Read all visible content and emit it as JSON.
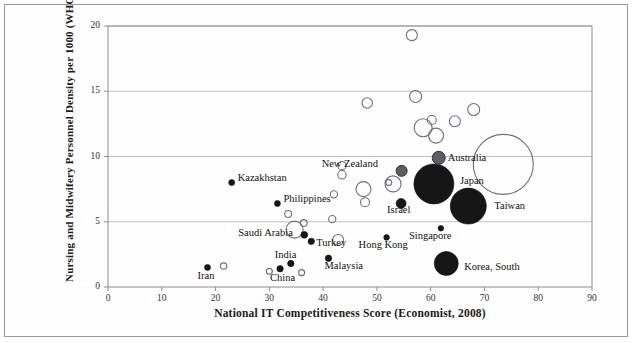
{
  "chart_data": {
    "type": "scatter",
    "title": "",
    "xlabel": "National IT Competitiveness Score (Economist, 2008)",
    "ylabel": "Nursing and Midwifery Personnel  Density per 1000 (WHO, 2009)",
    "xlim": [
      0,
      90
    ],
    "ylim": [
      0,
      20
    ],
    "xticks": [
      0,
      10,
      20,
      30,
      40,
      50,
      60,
      70,
      80,
      90
    ],
    "yticks": [
      0,
      5,
      10,
      15,
      20
    ],
    "grid": "horizontal",
    "legend": "none",
    "marker_styles": {
      "filled_black": "labeled country, small solid marker",
      "open_circle": "unlabeled country bubble",
      "gray_filled": "labeled country, medium gray marker",
      "large_black": "labeled country, large solid bubble"
    },
    "points": [
      {
        "label": "Iran",
        "x": 18.5,
        "y": 1.5,
        "r": 3,
        "style": "filled_black",
        "label_dx": -10,
        "label_dy": 9
      },
      {
        "label": "",
        "x": 21.5,
        "y": 1.6,
        "r": 3.2,
        "style": "open_circle"
      },
      {
        "label": "Kazakhstan",
        "x": 23.0,
        "y": 8.0,
        "r": 3,
        "style": "filled_black",
        "label_dx": 6,
        "label_dy": -5
      },
      {
        "label": "China",
        "x": 32.0,
        "y": 1.4,
        "r": 3.2,
        "style": "filled_black",
        "label_dx": -10,
        "label_dy": 9
      },
      {
        "label": "",
        "x": 30.0,
        "y": 1.2,
        "r": 3,
        "style": "open_circle"
      },
      {
        "label": "India",
        "x": 34.0,
        "y": 1.8,
        "r": 3.2,
        "style": "filled_black",
        "label_dx": -16,
        "label_dy": -9
      },
      {
        "label": "",
        "x": 36.0,
        "y": 1.1,
        "r": 3,
        "style": "open_circle"
      },
      {
        "label": "Saudi Arabia",
        "x": 36.5,
        "y": 4.0,
        "r": 3.4,
        "style": "filled_black",
        "label_dx": -66,
        "label_dy": -2
      },
      {
        "label": "",
        "x": 34.7,
        "y": 4.4,
        "r": 8.5,
        "style": "open_circle"
      },
      {
        "label": "",
        "x": 36.4,
        "y": 4.9,
        "r": 3.4,
        "style": "open_circle"
      },
      {
        "label": "Turkey",
        "x": 37.8,
        "y": 3.5,
        "r": 3.2,
        "style": "filled_black",
        "label_dx": 5,
        "label_dy": 2
      },
      {
        "label": "Malaysia",
        "x": 41.0,
        "y": 2.2,
        "r": 3.2,
        "style": "filled_black",
        "label_dx": -4,
        "label_dy": 8
      },
      {
        "label": "Philippines",
        "x": 31.5,
        "y": 6.4,
        "r": 3,
        "style": "filled_black",
        "label_dx": 6,
        "label_dy": -4
      },
      {
        "label": "",
        "x": 33.5,
        "y": 5.6,
        "r": 3.4,
        "style": "open_circle"
      },
      {
        "label": "",
        "x": 42.0,
        "y": 7.1,
        "r": 3.6,
        "style": "open_circle"
      },
      {
        "label": "",
        "x": 41.7,
        "y": 5.2,
        "r": 3.6,
        "style": "open_circle"
      },
      {
        "label": "",
        "x": 42.8,
        "y": 3.6,
        "r": 5.5,
        "style": "open_circle"
      },
      {
        "label": "",
        "x": 43.5,
        "y": 9.3,
        "r": 4.2,
        "style": "open_circle"
      },
      {
        "label": "",
        "x": 43.5,
        "y": 8.6,
        "r": 4.2,
        "style": "open_circle"
      },
      {
        "label": "",
        "x": 47.5,
        "y": 7.5,
        "r": 7.5,
        "style": "open_circle"
      },
      {
        "label": "",
        "x": 47.8,
        "y": 6.5,
        "r": 4.5,
        "style": "open_circle"
      },
      {
        "label": "",
        "x": 48.2,
        "y": 14.1,
        "r": 5.2,
        "style": "open_circle"
      },
      {
        "label": "",
        "x": 56.5,
        "y": 19.3,
        "r": 5.5,
        "style": "open_circle"
      },
      {
        "label": "",
        "x": 57.2,
        "y": 14.6,
        "r": 6.0,
        "style": "open_circle"
      },
      {
        "label": "New Zealand",
        "x": 54.6,
        "y": 8.9,
        "r": 5.5,
        "style": "gray_filled",
        "label_dx": -80,
        "label_dy": -7
      },
      {
        "label": "",
        "x": 53.0,
        "y": 7.9,
        "r": 8.0,
        "style": "open_circle"
      },
      {
        "label": "",
        "x": 52.2,
        "y": 8.0,
        "r": 3.0,
        "style": "open_circle"
      },
      {
        "label": "",
        "x": 58.6,
        "y": 12.2,
        "r": 9.0,
        "style": "open_circle"
      },
      {
        "label": "",
        "x": 60.2,
        "y": 12.8,
        "r": 4.5,
        "style": "open_circle"
      },
      {
        "label": "Israel",
        "x": 54.5,
        "y": 6.4,
        "r": 5.0,
        "style": "filled_black",
        "label_dx": -14,
        "label_dy": 7
      },
      {
        "label": "Hong Kong",
        "x": 51.8,
        "y": 3.8,
        "r": 2.8,
        "style": "filled_black",
        "label_dx": -28,
        "label_dy": 8
      },
      {
        "label": "Japan",
        "x": 60.6,
        "y": 7.9,
        "r": 20.0,
        "style": "large_black",
        "label_dx": 26,
        "label_dy": -3
      },
      {
        "label": "Australia",
        "x": 61.5,
        "y": 9.9,
        "r": 6.5,
        "style": "gray_filled",
        "label_dx": 9,
        "label_dy": 0
      },
      {
        "label": "",
        "x": 61.0,
        "y": 11.6,
        "r": 7.5,
        "style": "open_circle"
      },
      {
        "label": "",
        "x": 64.5,
        "y": 12.7,
        "r": 5.5,
        "style": "open_circle"
      },
      {
        "label": "Singapore",
        "x": 61.9,
        "y": 4.5,
        "r": 2.8,
        "style": "filled_black",
        "label_dx": -32,
        "label_dy": 8
      },
      {
        "label": "Taiwan",
        "x": 67.0,
        "y": 6.2,
        "r": 18.0,
        "style": "large_black",
        "label_dx": 26,
        "label_dy": 0
      },
      {
        "label": "Korea, South",
        "x": 62.9,
        "y": 1.8,
        "r": 12.0,
        "style": "large_black",
        "label_dx": 18,
        "label_dy": 3
      },
      {
        "label": "",
        "x": 73.5,
        "y": 9.4,
        "r": 30.0,
        "style": "open_circle"
      },
      {
        "label": "",
        "x": 68.0,
        "y": 13.6,
        "r": 6.0,
        "style": "open_circle"
      }
    ]
  }
}
